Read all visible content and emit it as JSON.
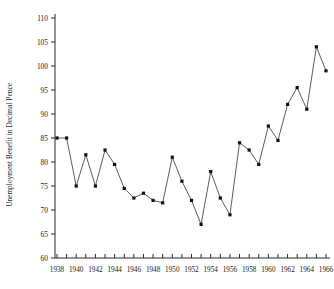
{
  "chart_data": {
    "type": "line",
    "title": "",
    "xlabel": "",
    "ylabel": "Unemployment Benefit in Decimal Pence",
    "xlim": [
      1938,
      1966
    ],
    "ylim": [
      60,
      110
    ],
    "ytick_step": 5,
    "xtick_step": 1,
    "xtick_label_step": 2,
    "grid": false,
    "legend": null,
    "yticks": [
      110,
      105,
      100,
      95,
      90,
      85,
      80,
      75,
      70,
      65,
      60
    ],
    "xticks": [
      1938,
      1939,
      1940,
      1941,
      1942,
      1943,
      1944,
      1945,
      1946,
      1947,
      1948,
      1949,
      1950,
      1951,
      1952,
      1953,
      1954,
      1955,
      1956,
      1957,
      1958,
      1959,
      1960,
      1961,
      1962,
      1963,
      1964,
      1965,
      1966
    ],
    "xtick_labels": [
      1938,
      1940,
      1942,
      1944,
      1946,
      1948,
      1950,
      1952,
      1954,
      1956,
      1958,
      1960,
      1962,
      1964,
      1966
    ],
    "x": [
      1938,
      1939,
      1940,
      1941,
      1942,
      1943,
      1944,
      1945,
      1946,
      1947,
      1948,
      1949,
      1950,
      1951,
      1952,
      1953,
      1954,
      1955,
      1956,
      1957,
      1958,
      1959,
      1960,
      1961,
      1962,
      1963,
      1964,
      1965,
      1966
    ],
    "values": [
      85,
      85,
      75,
      81.5,
      75,
      82.5,
      79.5,
      74.5,
      72.5,
      73.5,
      72,
      71.5,
      81,
      76,
      72,
      67,
      78,
      72.5,
      69,
      84,
      82.5,
      79.5,
      87.5,
      84.5,
      92,
      95.5,
      91,
      104,
      99
    ],
    "marker": "square",
    "line_color": "#4a4a4a",
    "marker_color": "#111111"
  }
}
